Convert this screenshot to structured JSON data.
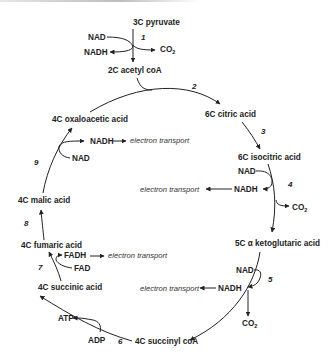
{
  "compounds": {
    "pyruvate": "3C pyruvate",
    "acetyl_coa": "2C acetyl coA",
    "citric": "6C citric acid",
    "isocitric": "6C isocitric acid",
    "ketoglutaric": "5C α ketoglutaric acid",
    "succinyl_coa": "4C succinyl coA",
    "succinic": "4C succinic acid",
    "fumaric": "4C fumaric acid",
    "malic": "4C malic acid",
    "oxaloacetic": "4C oxaloacetic acid"
  },
  "cofactors": {
    "nad": "NAD",
    "nadh": "NADH",
    "fad": "FAD",
    "fadh": "FADH",
    "atp": "ATP",
    "adp": "ADP",
    "co2": "CO",
    "co2_sub": "2"
  },
  "electron_transport": "electron transport",
  "steps": [
    "1",
    "2",
    "3",
    "4",
    "5",
    "6",
    "7",
    "8",
    "9"
  ]
}
